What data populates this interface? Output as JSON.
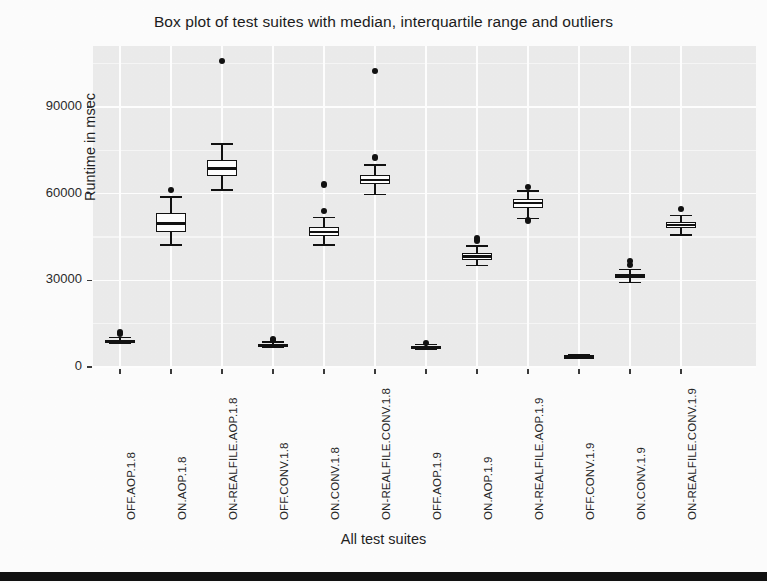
{
  "chart_data": {
    "type": "box",
    "title": "Box plot of test suites with median, interquartile range and outliers",
    "xlabel": "All test suites",
    "ylabel": "Runtime in msec",
    "ylim": [
      -2500,
      112000
    ],
    "yticks": [
      0,
      30000,
      60000,
      90000
    ],
    "ytick_labels": [
      "0",
      "30000",
      "60000",
      "90000"
    ],
    "grid": true,
    "legend": "none",
    "categories": [
      "OFF.AOP.1.8",
      "ON.AOP.1.8",
      "ON-REALFILE.AOP.1.8",
      "OFF.CONV.1.8",
      "ON.CONV.1.8",
      "ON-REALFILE.CONV.1.8",
      "OFF.AOP.1.9",
      "ON.AOP.1.9",
      "ON-REALFILE.AOP.1.9",
      "OFF.CONV.1.9",
      "ON.CONV.1.9",
      "ON-REALFILE.CONV.1.9"
    ],
    "boxes": [
      {
        "label": "OFF.AOP.1.8",
        "whisker_low": 8200,
        "q1": 8700,
        "median": 9000,
        "q3": 9400,
        "whisker_high": 10200,
        "outliers": [
          11500,
          12000
        ]
      },
      {
        "label": "ON.AOP.1.8",
        "whisker_low": 42200,
        "q1": 46800,
        "median": 49700,
        "q3": 53200,
        "whisker_high": 58900,
        "outliers": [
          61200
        ]
      },
      {
        "label": "ON-REALFILE.AOP.1.8",
        "whisker_low": 61300,
        "q1": 66200,
        "median": 68800,
        "q3": 71500,
        "whisker_high": 77100,
        "outliers": [
          106000
        ]
      },
      {
        "label": "OFF.CONV.1.8",
        "whisker_low": 6900,
        "q1": 7300,
        "median": 7600,
        "q3": 7900,
        "whisker_high": 8600,
        "outliers": [
          9400,
          9800
        ]
      },
      {
        "label": "ON.CONV.1.8",
        "whisker_low": 42300,
        "q1": 45200,
        "median": 46700,
        "q3": 48300,
        "whisker_high": 51700,
        "outliers": [
          54000,
          63200
        ]
      },
      {
        "label": "ON-REALFILE.CONV.1.8",
        "whisker_low": 59700,
        "q1": 63300,
        "median": 64700,
        "q3": 66300,
        "whisker_high": 69900,
        "outliers": [
          72500,
          102500
        ]
      },
      {
        "label": "OFF.AOP.1.9",
        "whisker_low": 6200,
        "q1": 6600,
        "median": 6900,
        "q3": 7200,
        "whisker_high": 7800,
        "outliers": [
          8400
        ]
      },
      {
        "label": "ON.AOP.1.9",
        "whisker_low": 35100,
        "q1": 37200,
        "median": 38300,
        "q3": 39500,
        "whisker_high": 41900,
        "outliers": [
          43800,
          44600
        ]
      },
      {
        "label": "ON-REALFILE.AOP.1.9",
        "whisker_low": 51400,
        "q1": 55200,
        "median": 56800,
        "q3": 58200,
        "whisker_high": 60900,
        "outliers": [
          62200,
          50700
        ]
      },
      {
        "label": "OFF.CONV.1.9",
        "whisker_low": 3100,
        "q1": 3400,
        "median": 3600,
        "q3": 3800,
        "whisker_high": 4200,
        "outliers": []
      },
      {
        "label": "ON.CONV.1.9",
        "whisker_low": 29300,
        "q1": 30700,
        "median": 31400,
        "q3": 32200,
        "whisker_high": 33700,
        "outliers": [
          35300,
          36600
        ]
      },
      {
        "label": "ON-REALFILE.CONV.1.9",
        "whisker_low": 45600,
        "q1": 48000,
        "median": 49100,
        "q3": 50200,
        "whisker_high": 52400,
        "outliers": [
          54700
        ]
      }
    ],
    "colors": {
      "panel_background": "#ececec",
      "grid_line": "#ffffff",
      "box_fill": "#ffffff",
      "box_stroke": "#111111",
      "text": "#1f1f1f"
    }
  }
}
